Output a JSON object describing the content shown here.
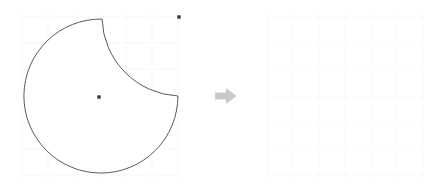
{
  "figure": {
    "background_color": "#ffffff",
    "stroke_color": "#5a5a5a",
    "stroke_width": 1,
    "grid_color": "#fafafa",
    "point_color": "#3b3b3b",
    "arrow_color": "#c9c9c9"
  },
  "left_panel": {
    "label": "source-shape",
    "description": "Large circle with a concave quarter notch cut from the upper-right region",
    "circle": {
      "label": "main-circle",
      "center_x": 99,
      "center_y": 97,
      "radius": 77
    },
    "notch": {
      "label": "notch-arc",
      "center_x": 179,
      "center_y": 17,
      "radius": 80,
      "type": "concave-arc"
    },
    "points": [
      {
        "label": "circle-center-point",
        "x": 99,
        "y": 97
      },
      {
        "label": "notch-center-point",
        "x": 179,
        "y": 17
      }
    ],
    "notch_start": {
      "x": 102,
      "y": 19
    },
    "notch_end": {
      "x": 178,
      "y": 96
    }
  },
  "arrow": {
    "label": "transform-arrow",
    "icon": "arrow-right-icon",
    "direction": "right",
    "color": "#c9c9c9"
  },
  "right_panel": {
    "label": "result-area",
    "description": "Empty faint grid area — target region",
    "grid_color": "#fbfbfb",
    "grid_spacing": 26
  }
}
